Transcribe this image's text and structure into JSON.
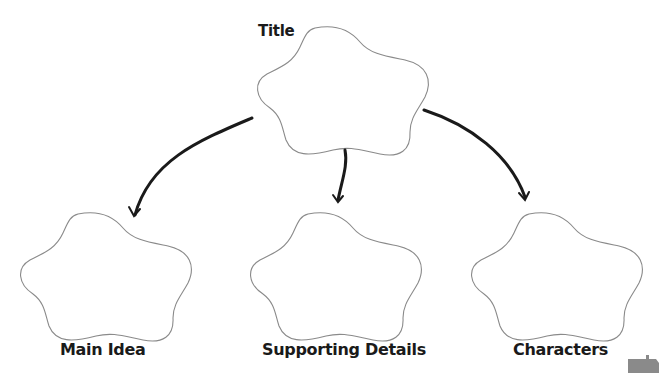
{
  "diagram": {
    "type": "graphic-organizer",
    "nodes": [
      {
        "id": "title",
        "label": "Title",
        "shape": "cloud-flower"
      },
      {
        "id": "main_idea",
        "label": "Main Idea",
        "shape": "cloud-flower"
      },
      {
        "id": "supporting_details",
        "label": "Supporting Details",
        "shape": "cloud-flower"
      },
      {
        "id": "characters",
        "label": "Characters",
        "shape": "cloud-flower"
      }
    ],
    "edges": [
      {
        "from": "title",
        "to": "main_idea"
      },
      {
        "from": "title",
        "to": "supporting_details"
      },
      {
        "from": "title",
        "to": "characters"
      }
    ]
  },
  "labels": {
    "title": "Title",
    "main_idea": "Main Idea",
    "supporting_details": "Supporting Details",
    "characters": "Characters"
  },
  "colors": {
    "outline": "#8a8a8a",
    "arrow": "#1a1a1a",
    "text": "#1a1a1a"
  }
}
